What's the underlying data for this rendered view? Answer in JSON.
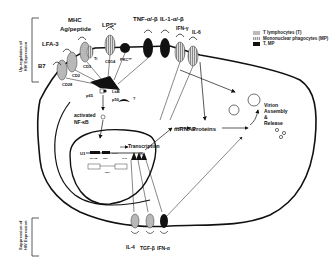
{
  "side_labels": {
    "upregulation": [
      "Up-regulation of",
      "HIV Expression"
    ],
    "suppression": [
      "Suppression of",
      "HIV Expression"
    ]
  },
  "legend": [
    {
      "swatch": "t",
      "label": "T lymphocytes (T)"
    },
    {
      "swatch": "m",
      "label": "Mononuclear phagocytes (MP)"
    },
    {
      "swatch": "k",
      "label": "T, MP"
    }
  ],
  "receptors_top": {
    "b7": "B7",
    "lfa3": "LFA-3",
    "mhc": "MHC",
    "ag_peptide": "Ag/peptide",
    "lps": "LPS*",
    "tnf": "TNF-α/-β",
    "il1": "IL-1-α/-β",
    "ifng": "IFN-γ",
    "il6": "IL-6",
    "cd28": "CD28",
    "cd2": "CD2",
    "cd3": "CD3",
    "ti": "Ti",
    "cd14": "CD14",
    "pkc": "PKC**"
  },
  "signaling": {
    "p65": "p65",
    "p50": "p50",
    "ikb": "I-κB",
    "question": "?",
    "activated": "activated",
    "nfkb": "NF-κB"
  },
  "nucleus": {
    "transcription": "Transcription",
    "ltr_left": "U3",
    "ltr_right": "R",
    "box1": "NF-κB",
    "box2": "Sp1",
    "box3": "TATA",
    "box4": "TAR"
  },
  "flow": {
    "mrnas": "mRNAs",
    "proteins": "Proteins",
    "assembly": [
      "Virion",
      "Assembly",
      "&",
      "Release"
    ],
    "rna_label": "RNA"
  },
  "receptors_bottom": {
    "il4": "IL-4",
    "tgfb": "TGF-β",
    "ifna": "IFN-α"
  }
}
